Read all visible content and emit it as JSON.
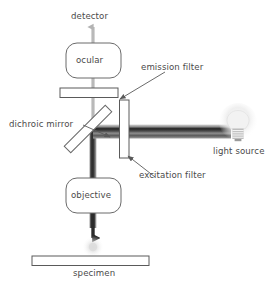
{
  "diagram": {
    "type": "schematic",
    "labels": {
      "detector": "detector",
      "ocular": "ocular",
      "emission_filter": "emission filter",
      "dichroic_mirror": "dichroic mirror",
      "excitation_filter": "excitation filter",
      "light_source": "light source",
      "objective": "objective",
      "specimen": "specimen"
    },
    "colors": {
      "stroke": "#5a5a5a",
      "text": "#4a4a4a",
      "emission_beam": "#b8b8b8",
      "excitation_beam": "#3a3a3a",
      "background": "#ffffff",
      "beam_band_light": "#cfcfcf",
      "beam_band_dark": "#2e2e2e",
      "bulb_glow": "#efefef"
    },
    "components": [
      {
        "name": "detector-arrow",
        "kind": "arrow",
        "direction": "up"
      },
      {
        "name": "ocular",
        "kind": "rounded-box"
      },
      {
        "name": "emission-filter",
        "kind": "horizontal-bar"
      },
      {
        "name": "dichroic-mirror",
        "kind": "diagonal-bar",
        "angle_deg": 45
      },
      {
        "name": "excitation-filter",
        "kind": "vertical-bar"
      },
      {
        "name": "light-source",
        "kind": "bulb"
      },
      {
        "name": "light-beam",
        "kind": "gradient-band"
      },
      {
        "name": "objective",
        "kind": "rounded-box"
      },
      {
        "name": "specimen",
        "kind": "horizontal-bar"
      },
      {
        "name": "focus-glow",
        "kind": "glow-spot"
      }
    ]
  }
}
